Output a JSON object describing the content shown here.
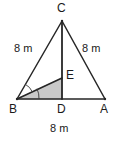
{
  "figure": {
    "stroke_color": "#262626",
    "shade_color": "#c9c9c9",
    "shade_stroke": "#8c8c8c",
    "background": "#ffffff"
  },
  "vertices": {
    "C": {
      "label": "C",
      "x": 62,
      "y": 21
    },
    "B": {
      "label": "B",
      "x": 17,
      "y": 99
    },
    "A": {
      "label": "A",
      "x": 105,
      "y": 99
    },
    "D": {
      "label": "D",
      "x": 62,
      "y": 99
    },
    "E": {
      "label": "E",
      "x": 62,
      "y": 78
    }
  },
  "side_labels": {
    "bc": "8 m",
    "ca": "8 m",
    "ba": "8 m"
  },
  "segments": [
    {
      "name": "side-BC",
      "from": "B",
      "to": "C"
    },
    {
      "name": "side-CA",
      "from": "C",
      "to": "A"
    },
    {
      "name": "side-BA",
      "from": "B",
      "to": "A"
    },
    {
      "name": "cevian-CD",
      "from": "C",
      "to": "D"
    },
    {
      "name": "segment-BE",
      "from": "B",
      "to": "E"
    }
  ],
  "shaded_region": {
    "name": "triangle-BDE",
    "points": "17,99 62,99 62,78"
  },
  "angle_marks": [
    {
      "name": "angle-arc-CBE",
      "radius": 16
    },
    {
      "name": "angle-arc-EBD",
      "radius": 22
    }
  ]
}
